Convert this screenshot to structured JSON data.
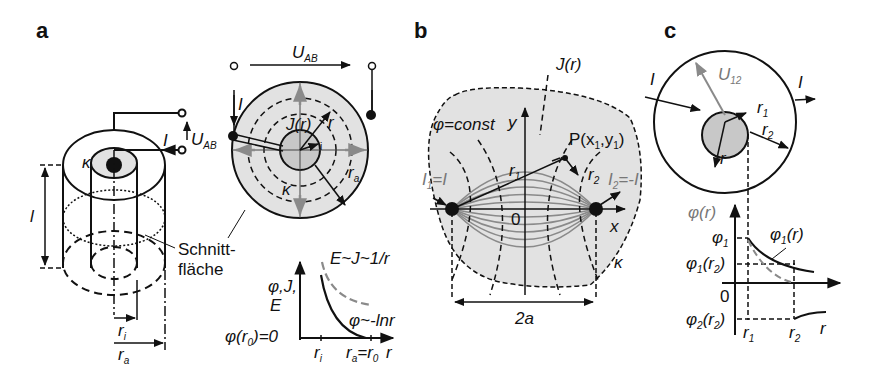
{
  "panels": {
    "a": {
      "label": "a",
      "cylinder": {
        "kappa": "κ",
        "length": "l",
        "current": "I",
        "voltage": "U",
        "voltage_sub": "AB",
        "r_inner": "r",
        "r_inner_sub": "i",
        "r_outer": "r",
        "r_outer_sub": "a",
        "section_label_1": "Schnitt-",
        "section_label_2": "fläche"
      },
      "cross_section": {
        "voltage": "U",
        "voltage_sub": "AB",
        "current": "I",
        "density": "J(r)",
        "radius": "r",
        "r_inner_sub": "i",
        "r_outer": "r",
        "r_outer_sub": "a",
        "kappa": "κ"
      },
      "graph": {
        "y_label_1": "φ,J,",
        "y_label_2": "E",
        "origin_label": "φ(r",
        "origin_sub": "0",
        "origin_eq": ")=0",
        "curve_dashed": "E~J~1/r",
        "curve_solid": "φ~-lnr",
        "x_tick_1": "r",
        "x_tick_1_sub": "i",
        "x_tick_2": "r",
        "x_tick_2_sub": "a",
        "x_tick_2_eq": "=r",
        "x_tick_2_sub2": "0",
        "x_axis": "r"
      }
    },
    "b": {
      "label": "b",
      "density": "J(r)",
      "equipotential": "φ=const",
      "y_axis": "y",
      "x_axis": "x",
      "origin": "0",
      "point": "P(x",
      "point_sub1": "1",
      "point_mid": ",y",
      "point_sub2": "1",
      "point_end": ")",
      "r1": "r",
      "r1_sub": "1",
      "r2": "r",
      "r2_sub": "2",
      "I1": "I",
      "I1_sub": "1",
      "I1_eq": "=I",
      "I2": "I",
      "I2_sub": "2",
      "I2_eq": "=-I",
      "distance": "2a",
      "kappa": "κ"
    },
    "c": {
      "label": "c",
      "voltage": "U",
      "voltage_sub": "12",
      "current_in": "I",
      "current_out": "I",
      "r1": "r",
      "r1_sub": "1",
      "r2": "r",
      "r2_sub": "2",
      "r": "r",
      "graph": {
        "y_label": "φ(r)",
        "phi1": "φ",
        "phi1_sub": "1",
        "phi1_r2": "φ",
        "phi1_r2_sub": "1",
        "phi1_r2_arg": "(r",
        "phi1_r2_argsub": "2",
        "phi1_r2_end": ")",
        "zero": "0",
        "phi2_r2": "φ",
        "phi2_r2_sub": "2",
        "phi2_r2_arg": "(r",
        "phi2_r2_argsub": "2",
        "phi2_r2_end": ")",
        "curve_label": "φ",
        "curve_label_sub": "1",
        "curve_label_end": "(r)",
        "x_tick_1": "r",
        "x_tick_1_sub": "1",
        "x_tick_2": "r",
        "x_tick_2_sub": "2",
        "x_axis": "r"
      }
    }
  },
  "colors": {
    "line": "#111111",
    "fill_light": "#e2e2e2",
    "fill_core": "#c8c8c8",
    "gray_accent": "#8a8a8a"
  }
}
